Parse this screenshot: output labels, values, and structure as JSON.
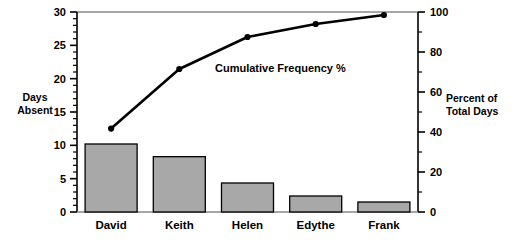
{
  "chart_data": {
    "type": "bar",
    "title": "",
    "categories": [
      "David",
      "Keith",
      "Helen",
      "Edythe",
      "Frank"
    ],
    "values": [
      10.2,
      8.3,
      4.35,
      2.4,
      1.5
    ],
    "ylabel": "Days Absent",
    "ylabel_line1": "Days",
    "ylabel_line2": "Absent",
    "xlabel": "",
    "ylim": [
      0,
      30
    ],
    "yticks": [
      0,
      5,
      10,
      15,
      20,
      25,
      30
    ],
    "ytick_labels": [
      "0",
      "5",
      "10",
      "15",
      "20",
      "25",
      "30"
    ],
    "y_minor_step": 1,
    "grid": false,
    "series": [
      {
        "name": "Days Absent",
        "type": "bar",
        "axis": "left",
        "values": [
          10.2,
          8.3,
          4.35,
          2.4,
          1.5
        ]
      },
      {
        "name": "Cumulative Frequency %",
        "type": "line",
        "axis": "right",
        "marker": "circle",
        "values": [
          41.7,
          71.5,
          87.5,
          94.0,
          98.5
        ]
      }
    ],
    "secondary_axis": {
      "label": "Percent of Total Days",
      "label_line1": "Percent of",
      "label_line2": "Total Days",
      "ylim": [
        0,
        100
      ],
      "yticks": [
        0,
        20,
        40,
        60,
        80,
        100
      ],
      "ytick_labels": [
        "0",
        "20",
        "40",
        "60",
        "80",
        "100"
      ],
      "y_minor_step": 10
    },
    "annotations": [
      {
        "name": "cumulative-frequency-label",
        "text": "Cumulative Frequency %",
        "x": 0.54,
        "y": 0.72
      }
    ],
    "legend": null,
    "legend_position": "none",
    "colors": {
      "bar_fill": "#a8a8a8",
      "bar_edge": "#000000",
      "line": "#000000",
      "marker": "#000000",
      "axis": "#000000",
      "top_rule": "#808080",
      "background": "#ffffff"
    }
  }
}
